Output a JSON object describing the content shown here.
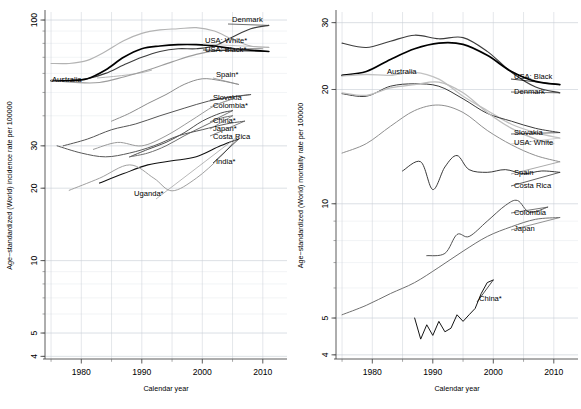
{
  "figure": {
    "type": "multi-panel-line-chart",
    "panels": 2,
    "background": "#ffffff"
  },
  "chart_data": [
    {
      "id": "incidence",
      "type": "line",
      "title": "",
      "xlabel": "Calendar year",
      "ylabel": "Age−standardized (World) incidence rate per 100000",
      "yscale": "log",
      "xlim": [
        1974,
        2014
      ],
      "ylim": [
        3.9,
        108
      ],
      "grid": true,
      "legend_position": "right-inline-labels",
      "xticks": [
        1980,
        1990,
        2000,
        2010
      ],
      "xticklabels": [
        "1980",
        "1990",
        "2000",
        "2010"
      ],
      "yticks": [
        4,
        5,
        10,
        20,
        30,
        100
      ],
      "yticklabels": [
        "4",
        "5",
        "10",
        "20",
        "30",
        "100"
      ],
      "series": [
        {
          "name": "Denmark",
          "label": "Denmark",
          "color": "#3d3d3d",
          "width": 1.15,
          "x": [
            1975,
            1978,
            1981,
            1984,
            1987,
            1990,
            1993,
            1996,
            1999,
            2002,
            2005,
            2008,
            2011
          ],
          "values": [
            56,
            56,
            57,
            60,
            65,
            70,
            74,
            76,
            76,
            78,
            85,
            92,
            95
          ]
        },
        {
          "name": "USA: White",
          "label": "USA: White*",
          "color": "#b3b3b3",
          "width": 1.15,
          "x": [
            1975,
            1978,
            1981,
            1984,
            1987,
            1990,
            1993,
            1996,
            1999,
            2002,
            2005,
            2008,
            2011
          ],
          "values": [
            66,
            66,
            68,
            74,
            82,
            88,
            91,
            92,
            93,
            90,
            83,
            78,
            77
          ]
        },
        {
          "name": "USA: Black",
          "label": "USA: Black*",
          "color": "#000000",
          "width": 1.7,
          "x": [
            1975,
            1978,
            1981,
            1984,
            1987,
            1990,
            1993,
            1996,
            1999,
            2002,
            2005,
            2008,
            2011
          ],
          "values": [
            56,
            56,
            57,
            62,
            70,
            76,
            78,
            79,
            79,
            78,
            76,
            75,
            74
          ]
        },
        {
          "name": "Spain",
          "label": "Spain*",
          "color": "#8c8c8c",
          "width": 1.0,
          "x": [
            1985,
            1988,
            1991,
            1994,
            1997,
            2000,
            2003,
            2006
          ],
          "values": [
            38,
            41,
            45,
            49,
            54,
            57,
            56,
            54
          ]
        },
        {
          "name": "Slovakia",
          "label": "Slovakia",
          "color": "#555555",
          "width": 1.0,
          "x": [
            1977,
            1981,
            1985,
            1989,
            1993,
            1997,
            2001,
            2005,
            2008
          ],
          "values": [
            30,
            32,
            35,
            37,
            40,
            43,
            46,
            48,
            49
          ]
        },
        {
          "name": "Colombia",
          "label": "Colombia*",
          "color": "#9a9a9a",
          "width": 1.0,
          "x": [
            1982,
            1986,
            1990,
            1994,
            1998,
            2002,
            2005
          ],
          "values": [
            29,
            31,
            30,
            33,
            38,
            44,
            47
          ]
        },
        {
          "name": "China",
          "label": "China*",
          "color": "#4d4d4d",
          "width": 1.0,
          "x": [
            1988,
            1991,
            1994,
            1997,
            2000,
            2003,
            2005
          ],
          "values": [
            27,
            29,
            31,
            34,
            38,
            41,
            42
          ]
        },
        {
          "name": "Japan",
          "label": "Japan*",
          "color": "#6e6e6e",
          "width": 1.0,
          "x": [
            1988,
            1991,
            1994,
            1997,
            2000,
            2003,
            2005
          ],
          "values": [
            27,
            28,
            30,
            33,
            36,
            39,
            40
          ]
        },
        {
          "name": "Costa Rica",
          "label": "Costa Rica",
          "color": "#585858",
          "width": 1.0,
          "x": [
            1976,
            1980,
            1984,
            1988,
            1992,
            1996,
            2000,
            2004,
            2007
          ],
          "values": [
            30,
            28,
            27,
            28,
            30,
            33,
            35,
            37,
            38
          ]
        },
        {
          "name": "India",
          "label": "India*",
          "color": "#111111",
          "width": 1.05,
          "x": [
            1983,
            1987,
            1991,
            1995,
            1999,
            2003,
            2006
          ],
          "values": [
            21,
            23,
            25,
            26,
            27,
            30,
            32
          ]
        },
        {
          "name": "Uganda",
          "label": "Uganda*",
          "color": "#a0a0a0",
          "width": 1.0,
          "x": [
            1978,
            1983,
            1988,
            1992,
            1995,
            1999,
            2003,
            2006
          ],
          "values": [
            19.6,
            22,
            25,
            22,
            19.5,
            22,
            27,
            33
          ]
        }
      ]
    },
    {
      "id": "mortality",
      "type": "line",
      "title": "",
      "xlabel": "Calendar year",
      "ylabel": "Age−standardized (World) mortality rate per 100000",
      "yscale": "log",
      "xlim": [
        1974,
        2014
      ],
      "ylim": [
        3.9,
        32
      ],
      "grid": true,
      "legend_position": "right-inline-labels",
      "xticks": [
        1980,
        1990,
        2000,
        2010
      ],
      "xticklabels": [
        "1980",
        "1990",
        "2000",
        "2010"
      ],
      "yticks": [
        4,
        5,
        10,
        20,
        30
      ],
      "yticklabels": [
        "4",
        "5",
        "10",
        "20",
        "30"
      ],
      "series": [
        {
          "name": "Denmark",
          "label": "Denmark",
          "color": "#3d3d3d",
          "width": 1.15,
          "x": [
            1975,
            1979,
            1983,
            1987,
            1991,
            1995,
            1999,
            2003,
            2007,
            2011
          ],
          "values": [
            26.5,
            25.8,
            26.8,
            27.8,
            27.2,
            27.4,
            25.2,
            22.2,
            20.3,
            19.6
          ]
        },
        {
          "name": "USA: Black",
          "label": "USA: Black",
          "color": "#000000",
          "width": 1.7,
          "x": [
            1975,
            1979,
            1983,
            1987,
            1991,
            1995,
            1999,
            2003,
            2007,
            2011
          ],
          "values": [
            21.8,
            22.3,
            24,
            25.6,
            26.5,
            26.3,
            24.6,
            22.3,
            21.0,
            20.6
          ]
        },
        {
          "name": "USA: White",
          "label": "USA: White",
          "color": "#c2c2c2",
          "width": 1.3,
          "x": [
            1975,
            1979,
            1983,
            1987,
            1991,
            1995,
            1999,
            2003,
            2007,
            2011
          ],
          "values": [
            21.7,
            21.9,
            21.8,
            22.2,
            21.3,
            19.2,
            17.6,
            16.2,
            15.4,
            14.9
          ]
        },
        {
          "name": "Slovakia",
          "label": "Slovakia",
          "color": "#3a3a3a",
          "width": 1.0,
          "x": [
            1975,
            1979,
            1983,
            1987,
            1991,
            1995,
            1999,
            2003,
            2007,
            2011
          ],
          "values": [
            19.5,
            19.2,
            20.4,
            20.7,
            20.4,
            18.9,
            17.3,
            16.5,
            15.8,
            15.4
          ]
        },
        {
          "name": "Spain",
          "label": "Spain",
          "color": "#8f8f8f",
          "width": 1.0,
          "x": [
            1975,
            1979,
            1983,
            1987,
            1991,
            1995,
            1999,
            2003,
            2007,
            2011
          ],
          "values": [
            13.6,
            14.4,
            16.0,
            17.6,
            18.2,
            17.4,
            15.6,
            14.3,
            13.4,
            12.9
          ]
        },
        {
          "name": "Costa Rica",
          "label": "Costa Rica",
          "color": "#2e2e2e",
          "width": 0.95,
          "x": [
            1985,
            1988,
            1990,
            1992,
            1994,
            1996,
            1999,
            2002,
            2005,
            2008,
            2011
          ],
          "values": [
            12.2,
            12.9,
            10.9,
            12.5,
            13.4,
            12.3,
            12.1,
            12.3,
            12.0,
            12.2,
            12.1
          ]
        },
        {
          "name": "Colombia",
          "label": "Colombia",
          "color": "#4a4a4a",
          "width": 0.95,
          "x": [
            1989,
            1992,
            1994,
            1996,
            1999,
            2002,
            2004,
            2006,
            2009
          ],
          "values": [
            7.3,
            7.4,
            8.3,
            8.2,
            9.0,
            9.9,
            10.2,
            9.5,
            9.8
          ]
        },
        {
          "name": "Japan",
          "label": "Japan",
          "color": "#707070",
          "width": 1.0,
          "x": [
            1975,
            1979,
            1983,
            1987,
            1991,
            1995,
            1999,
            2003,
            2007,
            2011
          ],
          "values": [
            5.1,
            5.4,
            5.8,
            6.2,
            6.8,
            7.5,
            8.2,
            8.7,
            9.1,
            9.2
          ]
        },
        {
          "name": "China",
          "label": "China*",
          "color": "#151515",
          "width": 1.0,
          "x": [
            1987,
            1988,
            1989,
            1990,
            1991,
            1992,
            1993,
            1994,
            1995,
            1996,
            1997,
            1998,
            1999,
            2000
          ],
          "values": [
            5.0,
            4.4,
            4.8,
            4.5,
            4.9,
            4.6,
            4.7,
            5.1,
            4.9,
            5.1,
            5.3,
            5.8,
            6.2,
            6.3
          ]
        }
      ]
    }
  ],
  "labels": {
    "left_axis_title": "Age−standardized (World) incidence rate per 100000",
    "right_axis_title": "Age−standardized (World) mortality rate per 100000",
    "xaxis_title": "Calendar year",
    "left_inline": [
      "Denmark",
      "USA: White*",
      "USA: Black*",
      "Australia",
      "Spain*",
      "Slovakia",
      "Colombia*",
      "China*",
      "Japan*",
      "Costa Rica",
      "India*",
      "Uganda*"
    ],
    "right_inline": [
      "Australia",
      "USA: Black",
      "Denmark",
      "Slovakia",
      "USA: White",
      "Spain",
      "Costa Rica",
      "Colombia",
      "Japan",
      "China*"
    ],
    "left_annotation_australia": "Australia",
    "right_annotation_australia": "Australia"
  }
}
